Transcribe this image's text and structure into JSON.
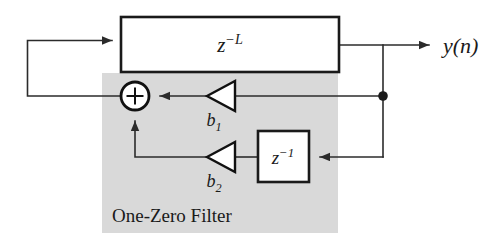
{
  "diagram": {
    "shaded_region_label": "One-Zero Filter",
    "colors": {
      "background": "#ffffff",
      "shade": "#d9d9d9",
      "line": "#2b2b2b",
      "outline": "#1a1a1a",
      "text": "#1a1a1a"
    },
    "blocks": [
      {
        "id": "delay-L",
        "label_base": "z",
        "label_exponent": "−L",
        "label_full": "z^-L",
        "x": 121,
        "y": 17,
        "width": 218,
        "height": 55
      },
      {
        "id": "delay-1",
        "label_base": "z",
        "label_exponent": "−1",
        "label_full": "z^-1",
        "x": 258,
        "y": 131,
        "width": 51,
        "height": 51
      }
    ],
    "gains": [
      {
        "id": "gain-b1",
        "label_base": "b",
        "label_subscript": "1",
        "label_full": "b1"
      },
      {
        "id": "gain-b2",
        "label_base": "b",
        "label_subscript": "2",
        "label_full": "b2"
      }
    ],
    "summer": {
      "id": "summing-junction",
      "symbol": "+",
      "cx": 135,
      "cy": 96,
      "r": 14
    },
    "output": {
      "id": "output-signal",
      "label_base": "y",
      "label_arg": "(n)",
      "label_full": "y(n)"
    },
    "tap": {
      "id": "signal-tap",
      "cx": 383,
      "cy": 96,
      "r": 4.6
    }
  }
}
